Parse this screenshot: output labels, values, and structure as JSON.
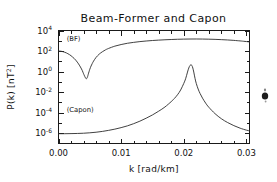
{
  "figure": {
    "title": "Beam-Former and Capon",
    "background_color": "#ffffff",
    "foreground_color": "#1a1a1a"
  },
  "chart_data": {
    "type": "line",
    "title": "Beam-Former and Capon",
    "xlabel": "k [rad/km]",
    "ylabel": "P(k) [nT²]",
    "xlabel_parts": {
      "symbol": "k",
      "units": "[rad/km]"
    },
    "ylabel_parts": {
      "symbol": "P(k)",
      "units": "[nT",
      "exponent": "2",
      "units_close": "]"
    },
    "xscale": "linear",
    "yscale": "log",
    "xlim": [
      0.0,
      0.0305
    ],
    "ylim": [
      1e-07,
      10000.0
    ],
    "grid": false,
    "legend_position": "inline-annotation",
    "xticks": [
      0.0,
      0.01,
      0.02,
      0.03
    ],
    "xtick_labels": [
      "0.00",
      "0.01",
      "0.02",
      "0.03"
    ],
    "x_minor_ticks_per_interval": 5,
    "yticks": [
      10000,
      100,
      1,
      0.01,
      0.0001,
      1e-06
    ],
    "ytick_labels": [
      {
        "mantissa": "10",
        "exponent": "4"
      },
      {
        "mantissa": "10",
        "exponent": "2"
      },
      {
        "mantissa": "10",
        "exponent": "0"
      },
      {
        "mantissa": "10",
        "exponent": "-2"
      },
      {
        "mantissa": "10",
        "exponent": "-4"
      },
      {
        "mantissa": "10",
        "exponent": "-6"
      }
    ],
    "y_minor_ticks_per_decade": 1,
    "annotations": [
      {
        "text": "(BF)",
        "x": 0.0013,
        "y": 900.0,
        "name": "beam-former-label"
      },
      {
        "text": "(Capon)",
        "x": 0.0013,
        "y": 0.00012,
        "name": "capon-label"
      }
    ],
    "series": [
      {
        "name": "Beam-Former",
        "short_name": "BF",
        "color": "#2b2b2b",
        "x": [
          0.0,
          0.00025,
          0.0005,
          0.00075,
          0.001,
          0.00125,
          0.0015,
          0.00175,
          0.002,
          0.00225,
          0.0025,
          0.00275,
          0.003,
          0.0032,
          0.0034,
          0.0036,
          0.0038,
          0.004,
          0.0041,
          0.0042,
          0.0043,
          0.00435,
          0.0044,
          0.00445,
          0.0045,
          0.00455,
          0.0046,
          0.00465,
          0.0047,
          0.0048,
          0.0049,
          0.005,
          0.0052,
          0.0054,
          0.0056,
          0.006,
          0.0065,
          0.007,
          0.0075,
          0.008,
          0.009,
          0.01,
          0.011,
          0.012,
          0.013,
          0.014,
          0.015,
          0.016,
          0.017,
          0.018,
          0.019,
          0.02,
          0.021,
          0.022,
          0.023,
          0.024,
          0.025,
          0.026,
          0.027,
          0.028,
          0.029,
          0.0295,
          0.03,
          0.0305
        ],
        "y": [
          100.0,
          98.0,
          93.0,
          85.0,
          76.0,
          66.0,
          55.0,
          45.0,
          35.0,
          26.0,
          19.0,
          13.0,
          8.4,
          5.6,
          3.6,
          2.2,
          1.25,
          0.62,
          0.45,
          0.33,
          0.25,
          0.22,
          0.21,
          0.2,
          0.21,
          0.23,
          0.27,
          0.33,
          0.42,
          0.7,
          1.1,
          1.7,
          3.5,
          6.3,
          10.5,
          24.0,
          50.0,
          85.0,
          130.0,
          180.0,
          300.0,
          430.0,
          570.0,
          700.0,
          830.0,
          950.0,
          1060.0,
          1160.0,
          1250.0,
          1330.0,
          1400.0,
          1450.0,
          1480.0,
          1490.0,
          1470.0,
          1430.0,
          1370.0,
          1290.0,
          1200.0,
          1090.0,
          970.0,
          900.0,
          840.0,
          770.0
        ]
      },
      {
        "name": "Capon",
        "short_name": "Capon",
        "color": "#2b2b2b",
        "x": [
          0.0,
          0.001,
          0.002,
          0.003,
          0.004,
          0.005,
          0.006,
          0.007,
          0.008,
          0.009,
          0.01,
          0.011,
          0.012,
          0.013,
          0.014,
          0.015,
          0.016,
          0.017,
          0.018,
          0.0185,
          0.019,
          0.0195,
          0.02,
          0.0203,
          0.0206,
          0.0208,
          0.021,
          0.02115,
          0.0213,
          0.02145,
          0.0216,
          0.0218,
          0.022,
          0.0223,
          0.0226,
          0.023,
          0.0235,
          0.024,
          0.025,
          0.026,
          0.027,
          0.028,
          0.029,
          0.03,
          0.0305
        ],
        "y": [
          9e-07,
          9e-07,
          9.2e-07,
          9.5e-07,
          1e-06,
          1.1e-06,
          1.25e-06,
          1.5e-06,
          1.9e-06,
          2.5e-06,
          3.5e-06,
          5.2e-06,
          8.5e-06,
          1.5e-05,
          2.9e-05,
          6e-05,
          0.00014,
          0.00036,
          0.0012,
          0.0024,
          0.0055,
          0.016,
          0.07,
          0.2,
          0.9,
          2.2,
          4.0,
          4.4,
          4.0,
          2.2,
          0.9,
          0.22,
          0.07,
          0.02,
          0.0075,
          0.0026,
          0.00085,
          0.00034,
          8e-05,
          2.6e-05,
          1.1e-05,
          5.5e-06,
          3.1e-06,
          2e-06,
          1.7e-06
        ]
      }
    ]
  },
  "artifacts": [
    {
      "name": "edge-smudge",
      "x": 265,
      "y": 96,
      "description": "small dark ink smudge at right edge"
    }
  ]
}
